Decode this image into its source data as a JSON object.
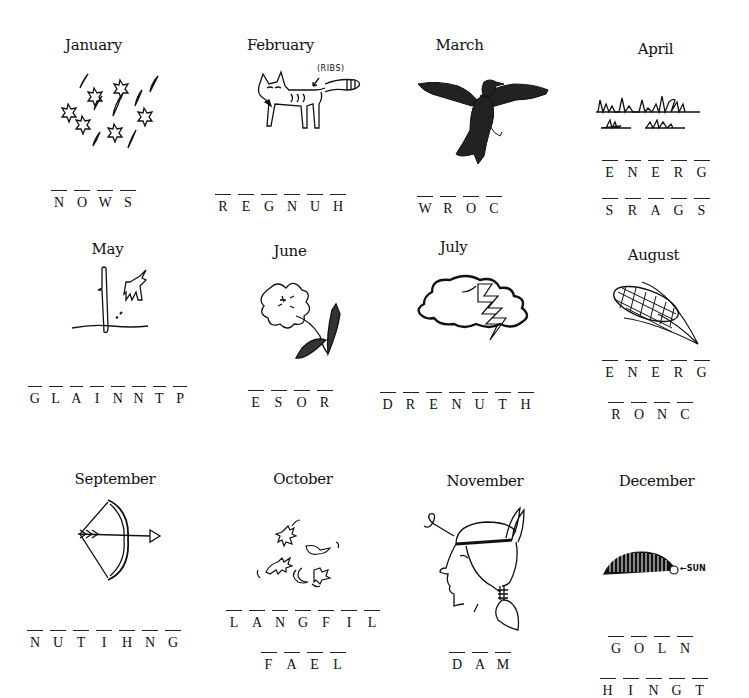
{
  "puzzle": {
    "months": [
      {
        "name": "January",
        "picture": "snowflakes-and-snow-icon",
        "scrambles": [
          [
            "N",
            "O",
            "W",
            "S"
          ]
        ]
      },
      {
        "name": "February",
        "picture": "thin-fox-icon",
        "annotation": "(RIBS)",
        "scrambles": [
          [
            "R",
            "E",
            "G",
            "N",
            "U",
            "H"
          ]
        ]
      },
      {
        "name": "March",
        "picture": "crow-icon",
        "scrambles": [
          [
            "W",
            "R",
            "O",
            "C"
          ]
        ]
      },
      {
        "name": "April",
        "picture": "grass-icon",
        "scrambles": [
          [
            "E",
            "N",
            "E",
            "R",
            "G"
          ],
          [
            "S",
            "R",
            "A",
            "G",
            "S"
          ]
        ]
      },
      {
        "name": "May",
        "picture": "hand-planting-icon",
        "scrambles": [
          [
            "G",
            "L",
            "A",
            "I",
            "N",
            "N",
            "T",
            "P"
          ]
        ]
      },
      {
        "name": "June",
        "picture": "flower-icon",
        "scrambles": [
          [
            "E",
            "S",
            "O",
            "R"
          ]
        ]
      },
      {
        "name": "July",
        "picture": "thundercloud-icon",
        "scrambles": [
          [
            "D",
            "R",
            "E",
            "N",
            "U",
            "T",
            "H"
          ]
        ]
      },
      {
        "name": "August",
        "picture": "corn-icon",
        "scrambles": [
          [
            "E",
            "N",
            "E",
            "R",
            "G"
          ],
          [
            "R",
            "O",
            "N",
            "C"
          ]
        ]
      },
      {
        "name": "September",
        "picture": "bow-and-arrow-icon",
        "scrambles": [
          [
            "N",
            "U",
            "T",
            "I",
            "H",
            "N",
            "G"
          ]
        ]
      },
      {
        "name": "October",
        "picture": "falling-leaves-icon",
        "scrambles": [
          [
            "L",
            "A",
            "N",
            "G",
            "F",
            "I",
            "L"
          ],
          [
            "F",
            "A",
            "E",
            "L"
          ]
        ]
      },
      {
        "name": "November",
        "picture": "native-head-icon",
        "scrambles": [
          [
            "D",
            "A",
            "M"
          ]
        ]
      },
      {
        "name": "December",
        "picture": "low-sun-arc-icon",
        "annotation": "SUN",
        "scrambles": [
          [
            "G",
            "O",
            "L",
            "N"
          ],
          [
            "H",
            "I",
            "N",
            "G",
            "T"
          ]
        ]
      }
    ]
  }
}
